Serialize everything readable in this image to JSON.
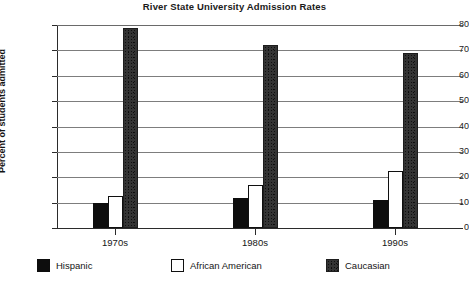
{
  "chart_data": {
    "type": "bar",
    "title": "River State University Admission Rates",
    "xlabel": "",
    "ylabel": "Percent of students admitted",
    "categories": [
      "1970s",
      "1980s",
      "1990s"
    ],
    "series": [
      {
        "name": "Hispanic",
        "values": [
          10,
          12,
          11
        ],
        "swatch": "solid-black",
        "color": "#0d0d0d"
      },
      {
        "name": "African American",
        "values": [
          12.5,
          17,
          22.5
        ],
        "swatch": "white-outline",
        "color": "#ffffff"
      },
      {
        "name": "Caucasian",
        "values": [
          79,
          72,
          69
        ],
        "swatch": "speckle",
        "color": "#343434"
      }
    ],
    "ylim": [
      0,
      80
    ],
    "yticks": [
      80,
      70,
      60,
      50,
      40,
      30,
      20,
      10,
      0
    ],
    "ytick_labels": [
      "80",
      "70",
      "60",
      "50",
      "40",
      "30",
      "20",
      "10",
      "0"
    ],
    "grid": true,
    "legend_position": "bottom"
  }
}
